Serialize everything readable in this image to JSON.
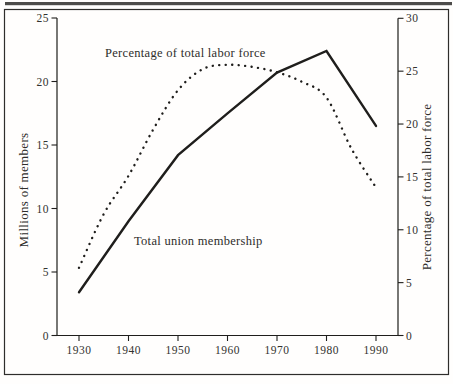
{
  "figure": {
    "background": "#fffefd",
    "scan_strip_color": "#4d4c4a",
    "frame_color": "#2e2d2b",
    "ink_color": "#1f1e1c",
    "text_color": "#2e2d2b"
  },
  "labels": {
    "top_annotation": "Percentage of total labor force",
    "bottom_annotation": "Total union membership",
    "left_axis_title": "Millions of members",
    "right_axis_title": "Percentage of total labor force"
  },
  "chart_data": {
    "type": "line",
    "title": "",
    "xlabel": "",
    "grid": "off",
    "legend": "none (labels placed inline next to lines)",
    "x_ticks": [
      1930,
      1940,
      1950,
      1960,
      1970,
      1980,
      1990
    ],
    "left_axis": {
      "label": "Millions of members",
      "ticks": [
        0,
        5,
        10,
        15,
        20,
        25
      ],
      "range": [
        0,
        25
      ]
    },
    "right_axis": {
      "label": "Percentage of total labor force",
      "ticks": [
        0,
        5,
        10,
        15,
        20,
        25,
        30
      ],
      "range": [
        0,
        30
      ]
    },
    "series": [
      {
        "name": "Total union membership",
        "axis": "left",
        "style": "solid",
        "units": "millions of members",
        "x": [
          1930,
          1940,
          1950,
          1960,
          1970,
          1980,
          1990
        ],
        "values": [
          3.4,
          9.0,
          14.2,
          17.5,
          20.7,
          22.4,
          16.5
        ]
      },
      {
        "name": "Percentage of total labor force",
        "axis": "right",
        "style": "dotted",
        "units": "percent of total labor force",
        "x": [
          1930,
          1935,
          1940,
          1945,
          1950,
          1955,
          1960,
          1965,
          1970,
          1975,
          1980,
          1985,
          1990
        ],
        "values": [
          6.4,
          11.5,
          15.1,
          19.5,
          23.2,
          25.2,
          25.6,
          25.4,
          24.9,
          24.0,
          22.5,
          17.7,
          14.0
        ]
      }
    ]
  }
}
